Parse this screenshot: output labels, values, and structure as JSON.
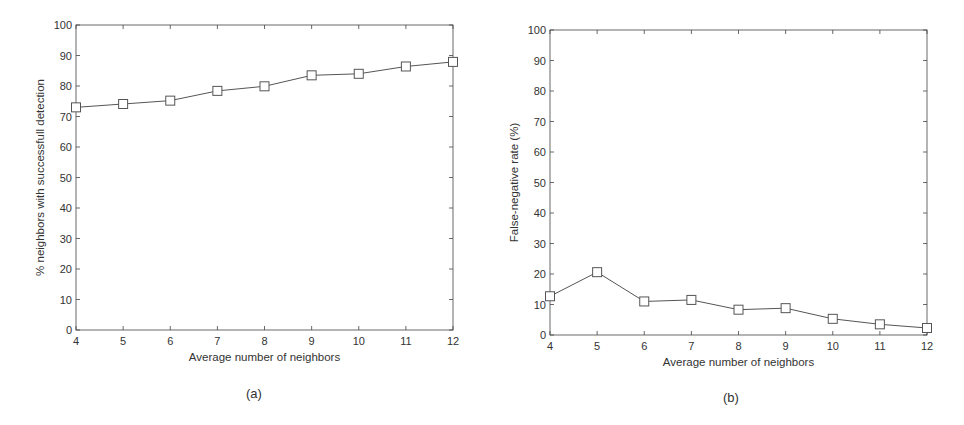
{
  "chart_data": [
    {
      "type": "line",
      "panel_label": "(a)",
      "title": "",
      "xlabel": "Average number of neighbors",
      "ylabel": "% neighbors with successfull detection",
      "x": [
        4,
        5,
        6,
        7,
        8,
        9,
        10,
        11,
        12
      ],
      "series": [
        {
          "name": "detection",
          "marker": "square",
          "values": [
            73.0,
            74.1,
            75.2,
            78.4,
            79.9,
            83.5,
            84.0,
            86.4,
            87.9
          ]
        }
      ],
      "xlim": [
        4,
        12
      ],
      "ylim": [
        0,
        100
      ],
      "xticks": [
        "4",
        "5",
        "6",
        "7",
        "8",
        "9",
        "10",
        "11",
        "12"
      ],
      "yticks": [
        "0",
        "10",
        "20",
        "30",
        "40",
        "50",
        "60",
        "70",
        "80",
        "90",
        "100"
      ],
      "grid": false,
      "legend": null
    },
    {
      "type": "line",
      "panel_label": "(b)",
      "title": "",
      "xlabel": "Average number of neighbors",
      "ylabel": "False-negative rate (%)",
      "x": [
        4,
        5,
        6,
        7,
        8,
        9,
        10,
        11,
        12
      ],
      "series": [
        {
          "name": "false-negative",
          "marker": "square",
          "values": [
            12.7,
            20.6,
            11.0,
            11.5,
            8.3,
            8.8,
            5.3,
            3.5,
            2.3
          ]
        }
      ],
      "xlim": [
        4,
        12
      ],
      "ylim": [
        0,
        100
      ],
      "xticks": [
        "4",
        "5",
        "6",
        "7",
        "8",
        "9",
        "10",
        "11",
        "12"
      ],
      "yticks": [
        "0",
        "10",
        "20",
        "30",
        "40",
        "50",
        "60",
        "70",
        "80",
        "90",
        "100"
      ],
      "grid": false,
      "legend": null
    }
  ],
  "colors": {
    "line": "#555555",
    "axis": "#444444",
    "text": "#333333"
  }
}
